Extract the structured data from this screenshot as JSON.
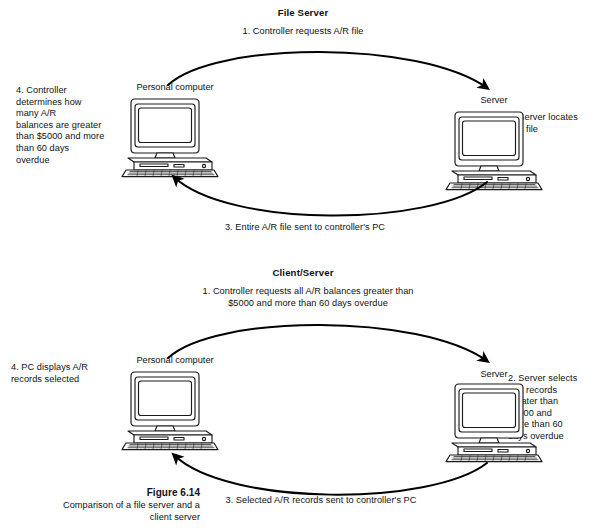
{
  "figure": {
    "caption_title": "Figure 6.14",
    "caption_line1": "Comparison of a file server and a",
    "caption_line2": "client server"
  },
  "diagrams": [
    {
      "id": "file-server",
      "title": "File Server",
      "client_label": "Personal computer",
      "server_label": "Server",
      "step_top": "1. Controller requests A/R file",
      "step_right": "2. Server locates\nA/R file",
      "step_bottom": "3. Entire A/R file sent to controller's PC",
      "step_left": "4. Controller\n    determines how\n    many A/R\n    balances are greater\n    than $5000 and more\n    than 60 days\n    overdue"
    },
    {
      "id": "client-server",
      "title": "Client/Server",
      "client_label": "Personal computer",
      "server_label": "Server",
      "step_top": "1. Controller requests all A/R balances greater than\n     $5000 and more than 60 days overdue",
      "step_right": "2. Server selects\n    A/R records\n    greater than\n    $5000 and\n    more than 60\n    days overdue",
      "step_bottom": "3. Selected A/R records sent to controller's PC",
      "step_left": "4. PC displays A/R\n    records selected"
    }
  ],
  "icons": {
    "computer": "desktop-computer-icon",
    "arrow_forward": "curved-arrow-right-icon",
    "arrow_return": "curved-arrow-left-icon"
  },
  "colors": {
    "ink": "#111111",
    "background": "#ffffff",
    "line": "#000000"
  }
}
